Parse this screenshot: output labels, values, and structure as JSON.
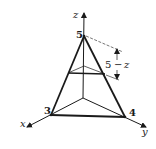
{
  "figure": {
    "type": "tetrahedron-diagram",
    "colors": {
      "stroke": "#1a1a1a",
      "background": "#ffffff"
    },
    "axes": {
      "x": {
        "label": "x"
      },
      "y": {
        "label": "y"
      },
      "z": {
        "label": "z"
      }
    },
    "vertices": {
      "x_intercept": {
        "label": "3",
        "value": 3
      },
      "y_intercept": {
        "label": "4",
        "value": 4
      },
      "z_intercept": {
        "label": "5",
        "value": 5
      }
    },
    "dimension": {
      "label_left": "5",
      "label_dash": "−",
      "label_right": "z",
      "text": "5 − z"
    },
    "cross_section": {
      "description": "horizontal triangular slice at height z"
    }
  }
}
